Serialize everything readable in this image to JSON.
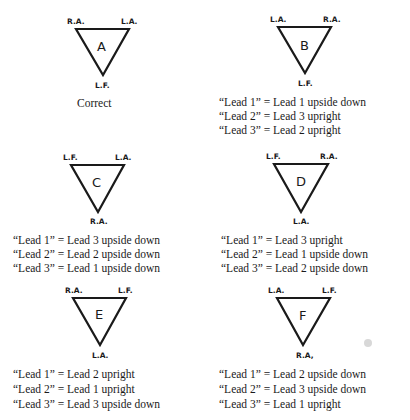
{
  "panels": [
    {
      "id": "A",
      "letter": "A",
      "top_left": "R.A.",
      "top_right": "L.A.",
      "bottom": "L.F.",
      "lines": [
        "Correct"
      ]
    },
    {
      "id": "B",
      "letter": "B",
      "top_left": "L.A.",
      "top_right": "R.A.",
      "bottom": "L.F.",
      "lines": [
        "“Lead 1” = Lead 1 upside down",
        "“Lead 2” = Lead 3 upright",
        "“Lead 3” = Lead 2 upright"
      ]
    },
    {
      "id": "C",
      "letter": "C",
      "top_left": "L.F.",
      "top_right": "L.A.",
      "bottom": "R.A.",
      "lines": [
        "“Lead 1” = Lead 3 upside down",
        "“Lead 2” = Lead 2 upside down",
        "“Lead 3” = Lead 1 upside down"
      ]
    },
    {
      "id": "D",
      "letter": "D",
      "top_left": "L.F.",
      "top_right": "R.A.",
      "bottom": "L.A.",
      "lines": [
        "“Lead 1” = Lead 3 upright",
        "“Lead 2” = Lead 1 upside down",
        "“Lead 3” = Lead 2 upside down"
      ]
    },
    {
      "id": "E",
      "letter": "E",
      "top_left": "R.A.",
      "top_right": "L.F.",
      "bottom": "L.A.",
      "lines": [
        "“Lead 1” = Lead 2 upright",
        "“Lead 2” = Lead 1 upright",
        "“Lead 3” = Lead 3 upside down"
      ]
    },
    {
      "id": "F",
      "letter": "F",
      "top_left": "L.A.",
      "top_right": "L.F.",
      "bottom": "R.A,",
      "lines": [
        "“Lead 1” = Lead 2 upside down",
        "“Lead 2” = Lead 3 upside down",
        "“Lead 3” = Lead 1 upright"
      ]
    }
  ]
}
